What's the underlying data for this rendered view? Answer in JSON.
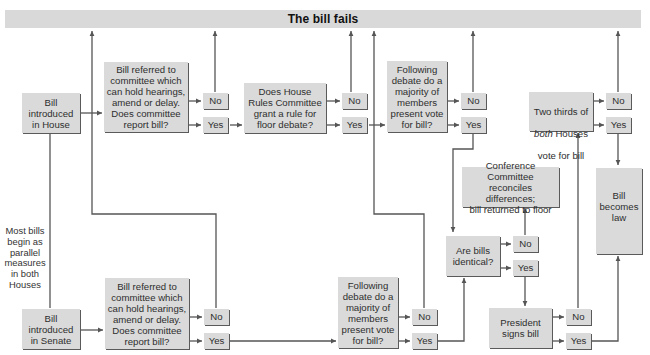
{
  "title": "The bill fails",
  "note": "Most bills\nbegin as\nparallel\nmeasures\nin both\nHouses",
  "house": {
    "intro": "Bill\nintroduced\nin House",
    "committee": "Bill referred to\ncommittee which\ncan hold hearings,\namend or delay.\nDoes committee\nreport bill?",
    "committee_no": "No",
    "committee_yes": "Yes",
    "rules": "Does House\nRules Committee\ngrant a rule for\nfloor debate?",
    "rules_no": "No",
    "rules_yes": "Yes",
    "floor": "Following\ndebate do a\nmajority of\nmembers\npresent vote\nfor bill?",
    "floor_no": "No",
    "floor_yes": "Yes"
  },
  "senate": {
    "intro": "Bill\nintroduced\nin Senate",
    "committee": "Bill referred to\ncommittee which\ncan hold hearings,\namend or delay.\nDoes committee\nreport bill?",
    "committee_no": "No",
    "committee_yes": "Yes",
    "floor": "Following\ndebate do a\nmajority of\nmembers\npresent vote\nfor bill?",
    "floor_no": "No",
    "floor_yes": "Yes"
  },
  "identical": {
    "question": "Are bills\nidentical?",
    "no": "No",
    "yes": "Yes"
  },
  "conference": "Conference Committee\nreconciles differences;\nbill returned to floor",
  "president": {
    "question": "President\nsigns bill",
    "no": "No",
    "yes": "Yes"
  },
  "override": {
    "line1": "Two thirds of",
    "line2_italic": "both",
    "line2_rest": " Houses",
    "line3": "vote for bill",
    "no": "No",
    "yes": "Yes"
  },
  "law": "Bill\nbecomes\nlaw",
  "colors": {
    "box_fill": "#dadada",
    "bar_fill": "#d9d9d9",
    "line": "#555555",
    "text": "#2e2e2e"
  }
}
